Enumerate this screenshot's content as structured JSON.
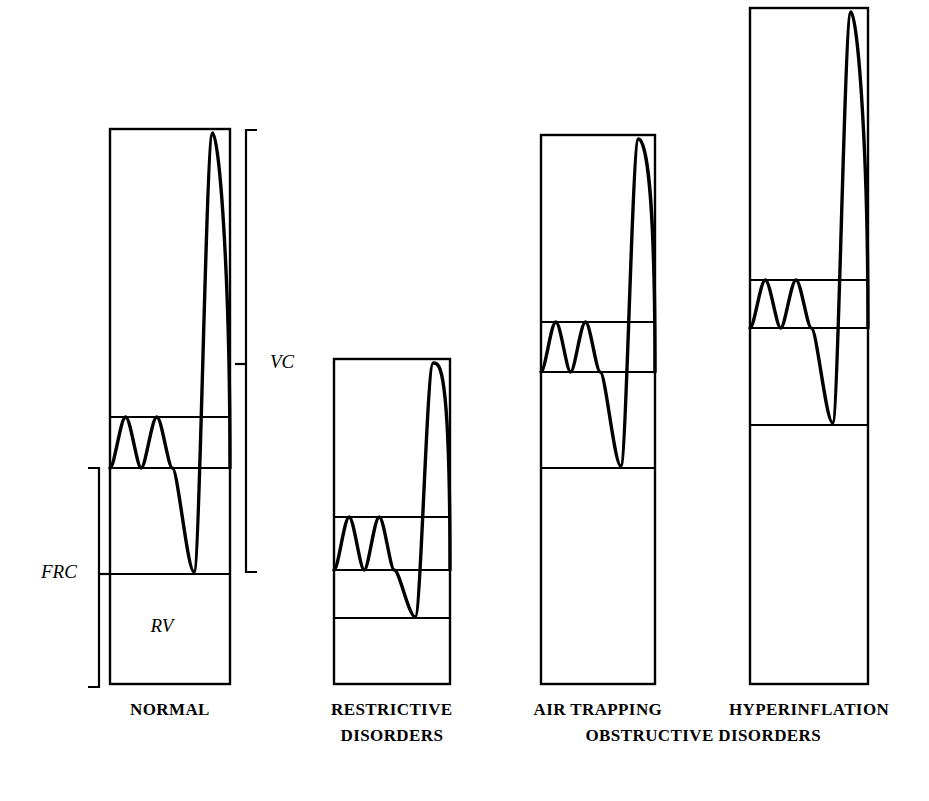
{
  "figure": {
    "width": 929,
    "height": 801,
    "background_color": "#ffffff",
    "line_color": "#000000"
  },
  "labels": {
    "vc": "VC",
    "frc": "FRC",
    "rv": "RV"
  },
  "captions": {
    "normal": "NORMAL",
    "restrictive_line1": "RESTRICTIVE",
    "restrictive_line2": "DISORDERS",
    "air_trapping": "AIR TRAPPING",
    "hyperinflation": "HYPERINFLATION",
    "obstructive": "OBSTRUCTIVE DISORDERS"
  },
  "chart_data": {
    "type": "diagram",
    "annotations": [
      "VC",
      "FRC",
      "RV"
    ],
    "columns": [
      {
        "name": "NORMAL",
        "x_left": 110,
        "x_right": 230,
        "y_top": 129,
        "y_bottom": 684,
        "total_height": 555,
        "dividers": [
          417,
          468,
          574
        ],
        "segments": [
          {
            "name": "IRV",
            "y_top": 129,
            "y_bottom": 417,
            "height": 288
          },
          {
            "name": "TV",
            "y_top": 417,
            "y_bottom": 468,
            "height": 51
          },
          {
            "name": "ERV",
            "y_top": 468,
            "y_bottom": 574,
            "height": 106
          },
          {
            "name": "RV",
            "y_top": 574,
            "y_bottom": 684,
            "height": 110
          }
        ],
        "tidal_breaths": 2,
        "tidal_top": 417,
        "tidal_bottom": 468,
        "maneuver_peak_y": 133,
        "maneuver_trough_y": 572
      },
      {
        "name": "RESTRICTIVE DISORDERS",
        "x_left": 334,
        "x_right": 450,
        "y_top": 359,
        "y_bottom": 684,
        "total_height": 325,
        "dividers": [
          517,
          570,
          618
        ],
        "segments": [
          {
            "name": "IRV",
            "y_top": 359,
            "y_bottom": 517,
            "height": 158
          },
          {
            "name": "TV",
            "y_top": 517,
            "y_bottom": 570,
            "height": 53
          },
          {
            "name": "ERV",
            "y_top": 570,
            "y_bottom": 618,
            "height": 48
          },
          {
            "name": "RV",
            "y_top": 618,
            "y_bottom": 684,
            "height": 66
          }
        ],
        "tidal_breaths": 2,
        "tidal_top": 517,
        "tidal_bottom": 570,
        "maneuver_peak_y": 363,
        "maneuver_trough_y": 617
      },
      {
        "name": "AIR TRAPPING",
        "x_left": 541,
        "x_right": 655,
        "y_top": 135,
        "y_bottom": 684,
        "total_height": 549,
        "dividers": [
          322,
          372,
          468
        ],
        "segments": [
          {
            "name": "IRV",
            "y_top": 135,
            "y_bottom": 322,
            "height": 187
          },
          {
            "name": "TV",
            "y_top": 322,
            "y_bottom": 372,
            "height": 50
          },
          {
            "name": "ERV",
            "y_top": 372,
            "y_bottom": 468,
            "height": 96
          },
          {
            "name": "RV",
            "y_top": 468,
            "y_bottom": 684,
            "height": 216
          }
        ],
        "tidal_breaths": 2,
        "tidal_top": 322,
        "tidal_bottom": 372,
        "maneuver_peak_y": 139,
        "maneuver_trough_y": 466
      },
      {
        "name": "HYPERINFLATION",
        "x_left": 750,
        "x_right": 868,
        "y_top": 8,
        "y_bottom": 684,
        "total_height": 676,
        "dividers": [
          280,
          328,
          425
        ],
        "segments": [
          {
            "name": "IRV",
            "y_top": 8,
            "y_bottom": 280,
            "height": 272
          },
          {
            "name": "TV",
            "y_top": 280,
            "y_bottom": 328,
            "height": 48
          },
          {
            "name": "ERV",
            "y_top": 328,
            "y_bottom": 425,
            "height": 97
          },
          {
            "name": "RV",
            "y_top": 425,
            "y_bottom": 684,
            "height": 259
          }
        ],
        "tidal_breaths": 2,
        "tidal_top": 280,
        "tidal_bottom": 328,
        "maneuver_peak_y": 12,
        "maneuver_trough_y": 423
      }
    ],
    "brackets": [
      {
        "label": "VC",
        "x": 246,
        "y_top": 130,
        "y_bottom": 572,
        "tick_y": 364,
        "side": "right"
      },
      {
        "label": "FRC",
        "x": 99,
        "y_top": 468,
        "y_bottom": 687,
        "tick_y": 574,
        "side": "left"
      }
    ]
  }
}
